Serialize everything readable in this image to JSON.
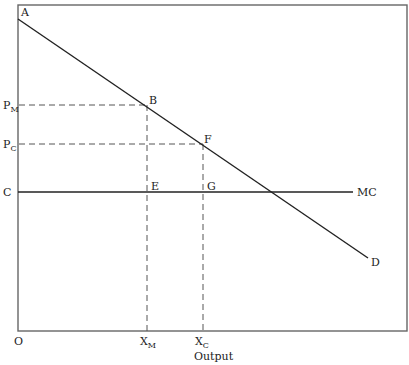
{
  "diagram": {
    "type": "monopoly-vs-competition",
    "x_axis_label": "Output",
    "origin_label": "O",
    "curves": {
      "demand": {
        "start_label": "A",
        "end_label": "D"
      },
      "marginal_cost": {
        "label": "MC",
        "y_label": "C"
      }
    },
    "price_labels": {
      "monopoly": {
        "main": "P",
        "sub": "M"
      },
      "competitive": {
        "main": "P",
        "sub": "C"
      }
    },
    "quantity_labels": {
      "monopoly": {
        "main": "X",
        "sub": "M"
      },
      "competitive": {
        "main": "X",
        "sub": "C"
      }
    },
    "points": {
      "B": "B",
      "F": "F",
      "E": "E",
      "G": "G"
    },
    "colors": {
      "line": "#222222",
      "dash": "#555555",
      "frame": "#666666"
    }
  }
}
